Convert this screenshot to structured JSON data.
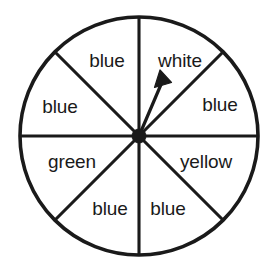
{
  "figure": {
    "kind": "probability-spinner",
    "background_color": "#ffffff",
    "line_color": "#1a1a1a",
    "sector_count": 8
  },
  "wheel": {
    "center_x": 139,
    "center_y": 136,
    "radius": 119,
    "hub_radius": 7
  },
  "pointer": {
    "tip_x": 160,
    "tip_y": 74,
    "points_to": "white"
  },
  "sectors": [
    {
      "label": "white",
      "position": "top-right",
      "text_x": 180,
      "text_y": 62,
      "angle_start": -90,
      "angle_end": -45
    },
    {
      "label": "blue",
      "position": "right-upper",
      "text_x": 220,
      "text_y": 106,
      "angle_start": -45,
      "angle_end": 0
    },
    {
      "label": "yellow",
      "position": "right-lower",
      "text_x": 206,
      "text_y": 163,
      "angle_start": 0,
      "angle_end": 45
    },
    {
      "label": "blue",
      "position": "bottom-right",
      "text_x": 168,
      "text_y": 210,
      "angle_start": 45,
      "angle_end": 90
    },
    {
      "label": "blue",
      "position": "bottom-left",
      "text_x": 110,
      "text_y": 210,
      "angle_start": 90,
      "angle_end": 135
    },
    {
      "label": "green",
      "position": "left-lower",
      "text_x": 72,
      "text_y": 163,
      "angle_start": 135,
      "angle_end": 180
    },
    {
      "label": "blue",
      "position": "left-upper",
      "text_x": 60,
      "text_y": 108,
      "angle_start": 180,
      "angle_end": 225
    },
    {
      "label": "blue",
      "position": "top-left",
      "text_x": 107,
      "text_y": 62,
      "angle_start": 225,
      "angle_end": 270
    }
  ],
  "dividers": [
    {
      "name": "vertical-divider",
      "x1": 139,
      "y1": 17,
      "x2": 139,
      "y2": 255
    },
    {
      "name": "horizontal-divider",
      "x1": 20,
      "y1": 136,
      "x2": 258,
      "y2": 136
    },
    {
      "name": "diagonal-divider-nwse",
      "x1": 55,
      "y1": 52,
      "x2": 223,
      "y2": 220
    },
    {
      "name": "diagonal-divider-nesw",
      "x1": 223,
      "y1": 52,
      "x2": 55,
      "y2": 220
    }
  ]
}
